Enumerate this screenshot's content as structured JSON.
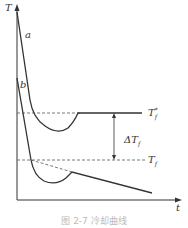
{
  "figure": {
    "axis_y_label": "T",
    "axis_x_label": "t",
    "curve_a_label": "a",
    "curve_b_label": "b",
    "line_top_label": "T",
    "line_top_sub": "f",
    "line_top_sup": "*",
    "line_bottom_label": "T",
    "line_bottom_sub": "f",
    "delta_label": "ΔT",
    "delta_sub": "f",
    "caption": "图 2-7  冷却曲线"
  },
  "colors": {
    "line": "#333333",
    "dash": "#555555"
  }
}
